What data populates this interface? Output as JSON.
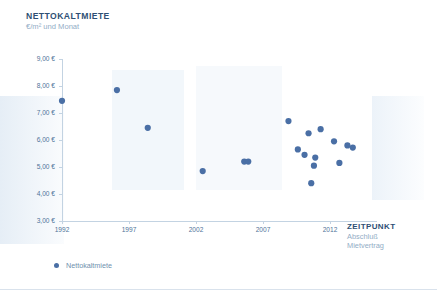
{
  "chart_data": {
    "type": "scatter",
    "title": "NETTOKALTMIETE",
    "subtitle": "€/m² und Monat",
    "xlabel": "ZEITPUNKT",
    "xlabel_sub1": "Abschluß",
    "xlabel_sub2": "Mietvertrag",
    "ylabel": "",
    "xlim": [
      1991.0,
      2015.5
    ],
    "ylim": [
      3.0,
      9.0
    ],
    "grid": false,
    "legend_position": "bottom-left",
    "accent_color": "#4a6fa5",
    "axis_color": "#c3d3e2",
    "title_color": "#2e4f74",
    "subtitle_color": "#93adc6",
    "xticks": [
      1992,
      1997,
      2002,
      2007,
      2012
    ],
    "xtick_labels": [
      "1992",
      "1997",
      "2002",
      "2007",
      "2012"
    ],
    "yticks": [
      3.0,
      4.0,
      5.0,
      6.0,
      7.0,
      8.0,
      9.0
    ],
    "ytick_labels": [
      "3,00 €",
      "4,00 €",
      "5,00 €",
      "6,00 €",
      "7,00 €",
      "8,00 €",
      "9,00 €"
    ],
    "series": [
      {
        "name": "Nettokaltmiete",
        "color": "#4a6fa5",
        "points": [
          {
            "x": 1992.0,
            "y": 7.45
          },
          {
            "x": 1996.1,
            "y": 7.85
          },
          {
            "x": 1998.4,
            "y": 6.45
          },
          {
            "x": 2002.5,
            "y": 4.85
          },
          {
            "x": 2005.6,
            "y": 5.2
          },
          {
            "x": 2005.9,
            "y": 5.2
          },
          {
            "x": 2008.9,
            "y": 6.7
          },
          {
            "x": 2011.3,
            "y": 6.4
          },
          {
            "x": 2010.4,
            "y": 6.25
          },
          {
            "x": 2012.3,
            "y": 5.95
          },
          {
            "x": 2009.6,
            "y": 5.65
          },
          {
            "x": 2010.1,
            "y": 5.45
          },
          {
            "x": 2013.3,
            "y": 5.8
          },
          {
            "x": 2013.7,
            "y": 5.72
          },
          {
            "x": 2010.9,
            "y": 5.35
          },
          {
            "x": 2010.8,
            "y": 5.05
          },
          {
            "x": 2012.7,
            "y": 5.15
          },
          {
            "x": 2010.6,
            "y": 4.4
          }
        ]
      }
    ]
  },
  "legend": {
    "items": [
      {
        "label": "Nettokaltmiete",
        "color": "#4a6fa5"
      }
    ]
  }
}
